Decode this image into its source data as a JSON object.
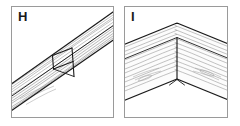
{
  "figure": {
    "background_color": "#ffffff",
    "width": 240,
    "height": 126,
    "style": "technical line drawing, wood joinery",
    "panels": [
      {
        "id": "H",
        "label": "H",
        "title": "",
        "caption": "",
        "subject": "single diagonal wooden beam with butt joint showing end-grain face",
        "border_color": "#9a9a9a",
        "outline_color": "#1a1a1a",
        "grain_color": "#8c8c8c",
        "fill_color": "#ffffff"
      },
      {
        "id": "I",
        "label": "I",
        "title": "",
        "caption": "",
        "subject": "two wooden beams meeting at a chevron apex with centre butt joint",
        "border_color": "#9a9a9a",
        "outline_color": "#1a1a1a",
        "grain_color": "#8c8c8c",
        "fill_color": "#ffffff"
      }
    ]
  }
}
